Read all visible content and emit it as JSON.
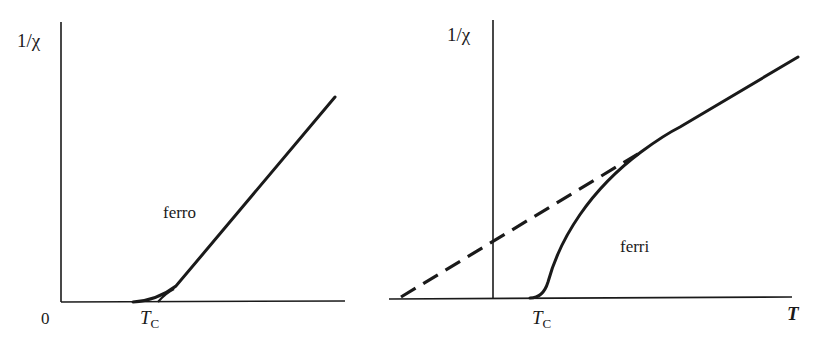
{
  "figure": {
    "line_color": "#1a1a1a",
    "background": "#ffffff"
  },
  "left_panel": {
    "y_axis_label": "1/χ",
    "origin_label": "0",
    "tc_label_main": "T",
    "tc_label_sub": "C",
    "curve_label": "ferro"
  },
  "right_panel": {
    "y_axis_label": "1/χ",
    "tc_label_main": "T",
    "tc_label_sub": "C",
    "x_axis_label": "T",
    "curve_label": "ferri",
    "extrapolation_style": "dashed"
  }
}
